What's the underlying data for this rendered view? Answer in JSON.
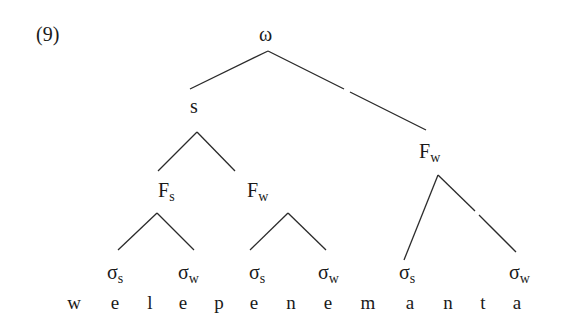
{
  "example_number": "(9)",
  "tree": {
    "root": "ω",
    "s_node": "s",
    "left_foot": {
      "base": "F",
      "sub": "s"
    },
    "mid_foot": {
      "base": "F",
      "sub": "w"
    },
    "right_foot": {
      "base": "F",
      "sub": "w"
    },
    "syllables": [
      {
        "base": "σ",
        "sub": "s"
      },
      {
        "base": "σ",
        "sub": "w"
      },
      {
        "base": "σ",
        "sub": "s"
      },
      {
        "base": "σ",
        "sub": "w"
      },
      {
        "base": "σ",
        "sub": "s"
      },
      {
        "base": "σ",
        "sub": "w"
      }
    ],
    "segments": [
      "w",
      "e",
      "l",
      "e",
      "p",
      "e",
      "n",
      "e",
      "m",
      "a",
      "n",
      "t",
      "a"
    ]
  },
  "colors": {
    "ink": "#1a1a1a",
    "background": "#ffffff"
  }
}
